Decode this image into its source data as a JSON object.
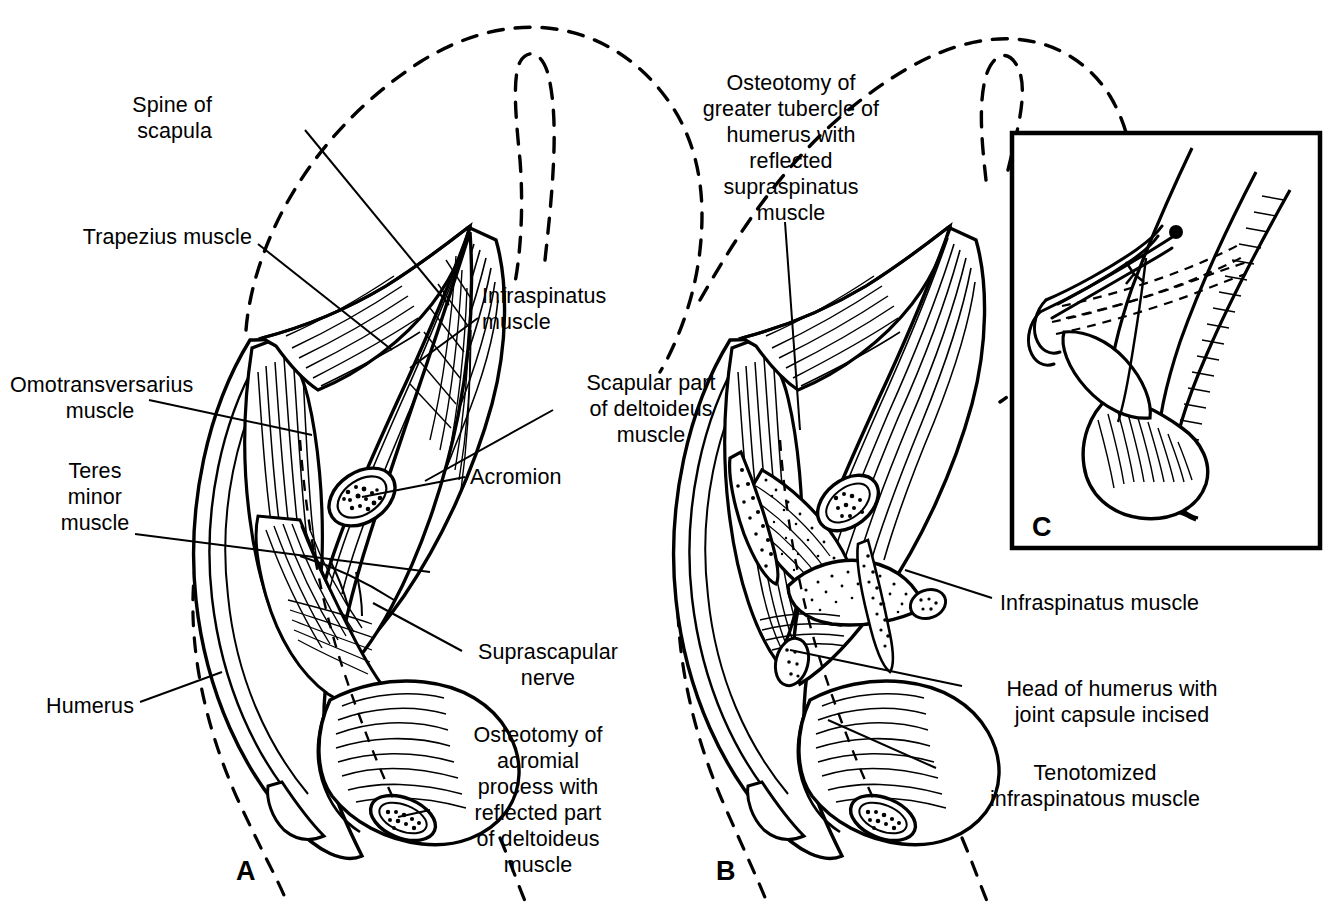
{
  "figure": {
    "type": "anatomical-surgical-illustration",
    "background_color": "#ffffff",
    "ink_color": "#000000",
    "panels": [
      {
        "id": "A",
        "letter": "A",
        "x": 245,
        "y": 872,
        "description": "Superficial dissection: acromial process osteotomized, deltoideus reflected distally, exposing infraspinatus and teres minor"
      },
      {
        "id": "B",
        "letter": "B",
        "x": 725,
        "y": 872,
        "description": "Deeper dissection: infraspinatus tenotomized, greater tubercle osteotomized with supraspinatus reflected, joint capsule incised exposing humeral head"
      },
      {
        "id": "C",
        "letter": "C",
        "x": 1040,
        "y": 528,
        "description": "Inset: reattachment of osteotomized tubercle with bone-holding forceps and dashed drill-hole / wire lines"
      }
    ],
    "inset_box": {
      "x": 1012,
      "y": 133,
      "width": 308,
      "height": 415,
      "border_px": 4
    }
  },
  "labels": {
    "left": [
      {
        "name": "spine-of-scapula",
        "text": "Spine of\nscapula",
        "x": 212,
        "y": 92,
        "align": "right",
        "leader": [
          [
            305,
            130
          ],
          [
            449,
            305
          ]
        ]
      },
      {
        "name": "trapezius-muscle",
        "text": "Trapezius muscle",
        "x": 92,
        "y": 224,
        "align": "right",
        "leader": [
          [
            258,
            244
          ],
          [
            392,
            350
          ]
        ]
      },
      {
        "name": "omotransversarius-muscle",
        "text": "Omotransversarius\nmuscle",
        "x": 25,
        "y": 372,
        "align": "right",
        "leader": [
          [
            149,
            400
          ],
          [
            312,
            435
          ]
        ]
      },
      {
        "name": "teres-minor-muscle",
        "text": "Teres\nminor\nmuscle",
        "x": 70,
        "y": 458,
        "align": "right",
        "leader": [
          [
            135,
            534
          ],
          [
            430,
            572
          ]
        ]
      },
      {
        "name": "humerus",
        "text": "Humerus",
        "x": 42,
        "y": 693,
        "align": "right",
        "leader": [
          [
            140,
            702
          ],
          [
            222,
            672
          ]
        ]
      }
    ],
    "center": [
      {
        "name": "infraspinatus-muscle-a",
        "text": "Infraspinatus\nmuscle",
        "x": 482,
        "y": 283,
        "align": "left",
        "leader": [
          [
            478,
            318
          ],
          [
            410,
            368
          ]
        ]
      },
      {
        "name": "scapular-part-deltoideus",
        "text": "Scapular part\nof deltoideus\nmuscle",
        "x": 558,
        "y": 372,
        "align": "left",
        "leader": [
          [
            553,
            410
          ],
          [
            425,
            481
          ]
        ]
      },
      {
        "name": "acromion",
        "text": "Acromion",
        "x": 470,
        "y": 465,
        "align": "left",
        "leader": [
          [
            465,
            477
          ],
          [
            362,
            497
          ]
        ]
      },
      {
        "name": "suprascapular-nerve",
        "text": "Suprascapular\nnerve",
        "x": 466,
        "y": 640,
        "align": "left",
        "leader": [
          [
            462,
            651
          ],
          [
            373,
            603
          ]
        ]
      },
      {
        "name": "osteotomy-acromial-process",
        "text": "Osteotomy of\nacromial\nprocess with\nreflected part\nof deltoideus\nmuscle",
        "x": 443,
        "y": 723,
        "align": "center",
        "leader": [
          [
            430,
            810
          ],
          [
            398,
            817
          ]
        ]
      }
    ],
    "top": [
      {
        "name": "osteotomy-greater-tubercle",
        "text": "Osteotomy of\ngreater tubercle of\nhumerus with\nreflected\nsupraspinatus\nmuscle",
        "x": 700,
        "y": 70,
        "align": "center",
        "leader": [
          [
            785,
            222
          ],
          [
            800,
            430
          ]
        ]
      }
    ],
    "right": [
      {
        "name": "infraspinatus-muscle-b",
        "text": "Infraspinatus muscle",
        "x": 998,
        "y": 590,
        "align": "left",
        "leader": [
          [
            992,
            598
          ],
          [
            905,
            570
          ]
        ]
      },
      {
        "name": "head-of-humerus",
        "text": "Head of humerus with\njoint capsule incised",
        "x": 968,
        "y": 678,
        "align": "left",
        "leader": [
          [
            962,
            686
          ],
          [
            790,
            650
          ]
        ]
      },
      {
        "name": "tenotomized-infraspinatous",
        "text": "Tenotomized\ninfraspinatous muscle",
        "x": 942,
        "y": 762,
        "align": "left",
        "leader": [
          [
            936,
            768
          ],
          [
            828,
            720
          ]
        ]
      }
    ]
  }
}
